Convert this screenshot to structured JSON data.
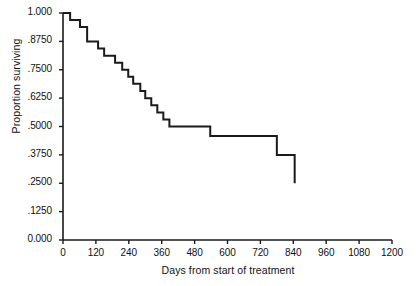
{
  "chart_data": {
    "type": "line",
    "subtype": "kaplan-meier-step",
    "title": "",
    "xlabel": "Days from start of treatment",
    "ylabel": "Proportion surviving",
    "xlim": [
      0,
      1200
    ],
    "ylim": [
      0.0,
      1.0
    ],
    "xticks": [
      0,
      120,
      240,
      360,
      480,
      600,
      720,
      840,
      960,
      1080,
      1200
    ],
    "xtick_labels": [
      "0",
      "120",
      "240",
      "360",
      "480",
      "600",
      "720",
      "840",
      "960",
      "1080",
      "1200"
    ],
    "yticks": [
      0.0,
      0.125,
      0.25,
      0.375,
      0.5,
      0.625,
      0.75,
      0.875,
      1.0
    ],
    "ytick_labels": [
      "0.000",
      ".1250",
      ".2500",
      ".3750",
      ".5000",
      ".6250",
      ".7500",
      ".8750",
      "1.000"
    ],
    "grid": false,
    "legend": false,
    "line_color": "#1a1a1a",
    "line_width": 2.0,
    "series": [
      {
        "name": "Survival",
        "step_x": [
          0,
          26,
          26,
          62,
          62,
          88,
          88,
          128,
          128,
          150,
          150,
          190,
          190,
          216,
          216,
          238,
          238,
          256,
          256,
          282,
          282,
          300,
          300,
          322,
          322,
          344,
          344,
          366,
          366,
          388,
          388,
          537,
          537,
          780,
          780,
          845,
          845
        ],
        "step_y": [
          1.0,
          1.0,
          0.969,
          0.969,
          0.938,
          0.938,
          0.875,
          0.875,
          0.844,
          0.844,
          0.812,
          0.812,
          0.781,
          0.781,
          0.75,
          0.75,
          0.719,
          0.719,
          0.688,
          0.688,
          0.656,
          0.656,
          0.625,
          0.625,
          0.594,
          0.594,
          0.562,
          0.562,
          0.531,
          0.531,
          0.5,
          0.5,
          0.458,
          0.458,
          0.375,
          0.375,
          0.25
        ],
        "event_times": [
          26,
          62,
          88,
          128,
          150,
          190,
          216,
          238,
          256,
          282,
          300,
          322,
          344,
          366,
          388,
          537,
          780,
          845
        ],
        "survival_after_event": [
          0.969,
          0.938,
          0.875,
          0.844,
          0.812,
          0.781,
          0.75,
          0.719,
          0.688,
          0.656,
          0.625,
          0.594,
          0.562,
          0.531,
          0.5,
          0.458,
          0.375,
          0.25
        ]
      }
    ]
  }
}
